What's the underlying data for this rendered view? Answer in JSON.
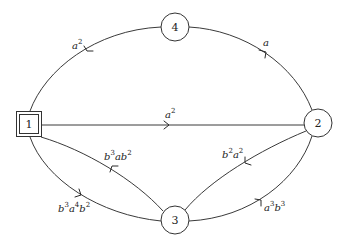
{
  "diagram": {
    "type": "state-transition-graph",
    "nodes": [
      {
        "id": "1",
        "label": "1",
        "shape": "double-square",
        "x": 29,
        "y": 124
      },
      {
        "id": "2",
        "label": "2",
        "shape": "circle",
        "x": 318,
        "y": 123
      },
      {
        "id": "3",
        "label": "3",
        "shape": "circle",
        "x": 175,
        "y": 220
      },
      {
        "id": "4",
        "label": "4",
        "shape": "circle",
        "x": 175,
        "y": 27
      }
    ],
    "edges": [
      {
        "from": "4",
        "to": "1",
        "label": "a²",
        "base": "a",
        "sup": "2"
      },
      {
        "from": "2",
        "to": "4",
        "label": "a",
        "base": "a",
        "sup": ""
      },
      {
        "from": "1",
        "to": "2",
        "label": "a²",
        "base": "a",
        "sup": "2"
      },
      {
        "from": "3",
        "to": "1",
        "label": "b³ab²"
      },
      {
        "from": "1",
        "to": "3",
        "label": "b³a⁴b²"
      },
      {
        "from": "2",
        "to": "3",
        "label": "b²a²"
      },
      {
        "from": "3",
        "to": "2",
        "label": "a³b³"
      }
    ]
  },
  "labels": {
    "node1": "1",
    "node2": "2",
    "node3": "3",
    "node4": "4",
    "e41": {
      "p1": "a",
      "s1": "2"
    },
    "e24": {
      "p1": "a"
    },
    "e12": {
      "p1": "a",
      "s1": "2"
    },
    "e31": {
      "p1": "b",
      "s1": "3",
      "p2": "ab",
      "s2": "2"
    },
    "e13": {
      "p1": "b",
      "s1": "3",
      "p2": "a",
      "s2": "4",
      "p3": "b",
      "s3": "2"
    },
    "e23": {
      "p1": "b",
      "s1": "2",
      "p2": "a",
      "s2": "2"
    },
    "e32": {
      "p1": "a",
      "s1": "3",
      "p2": "b",
      "s2": "3"
    }
  }
}
